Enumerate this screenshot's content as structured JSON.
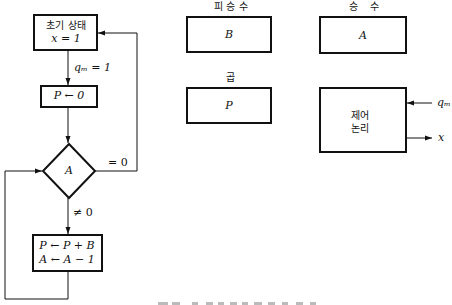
{
  "flowchart": {
    "initial_state": {
      "line1": "초기 상태",
      "line2": "x = 1"
    },
    "edge_start": "qₘ = 1",
    "clear_p": "P ← 0",
    "decision": "A",
    "edge_zero": "= 0",
    "edge_nonzero": "≠ 0",
    "loop_body": {
      "line1": "P ← P + B",
      "line2": "A ← A − 1"
    }
  },
  "registers": {
    "multiplicand": {
      "title": "피 승 수",
      "name": "B"
    },
    "multiplier": {
      "title": "승    수",
      "name": "A"
    },
    "product": {
      "title": "곱",
      "name": "P"
    }
  },
  "control": {
    "line1": "제어",
    "line2": "논리",
    "input": "qₘ",
    "output": "x"
  },
  "colors": {
    "ink": "#111111",
    "background": "#ffffff"
  }
}
